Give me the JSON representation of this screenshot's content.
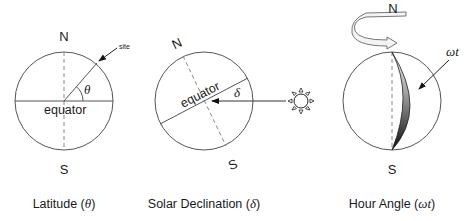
{
  "panels": [
    {
      "id": "latitude",
      "caption_text": "Latitude (",
      "caption_symbol": "θ",
      "caption_close": ")",
      "north_label": "N",
      "south_label": "S",
      "equator_label": "equator",
      "angle_symbol": "θ",
      "pointer_label": "site"
    },
    {
      "id": "declination",
      "caption_text": "Solar Declination (",
      "caption_symbol": "δ",
      "caption_close": ")",
      "north_label": "N",
      "south_label": "S",
      "equator_label": "equator",
      "angle_symbol": "δ"
    },
    {
      "id": "hour_angle",
      "caption_text": "Hour Angle (",
      "caption_symbol": "ωt",
      "caption_close": ")",
      "north_label": "N",
      "south_label": "S",
      "angle_symbol": "ωt"
    }
  ],
  "colors": {
    "line": "#555555",
    "dashed_axis": "#888888",
    "text": "#1a1a1a",
    "shade_light": "#e6e6e6",
    "shade_dark": "#111111"
  }
}
